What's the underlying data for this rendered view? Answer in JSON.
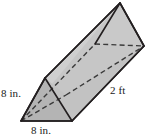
{
  "figure": {
    "name": "triangular-prism",
    "labels": {
      "height": "8 in.",
      "base": "8 in.",
      "length": "2 ft"
    },
    "colors": {
      "front_face": "#a8a8a8",
      "top_face": "#cccccc",
      "side_face": "#bdbdbd",
      "back_face": "#c4c4c4",
      "outline": "#231f20",
      "hidden_edge": "#3a3a3a",
      "background": "#ffffff",
      "label_text": "#1a1a1a"
    },
    "geometry": {
      "front_triangle": {
        "apex": [
          45,
          78
        ],
        "left": [
          21,
          121
        ],
        "right": [
          72,
          121
        ]
      },
      "back_triangle": {
        "apex": [
          120,
          3
        ],
        "left_hidden": [
          95,
          44
        ],
        "right": [
          144,
          46
        ]
      },
      "hidden_vertex_front": [
        66,
        95
      ]
    }
  }
}
